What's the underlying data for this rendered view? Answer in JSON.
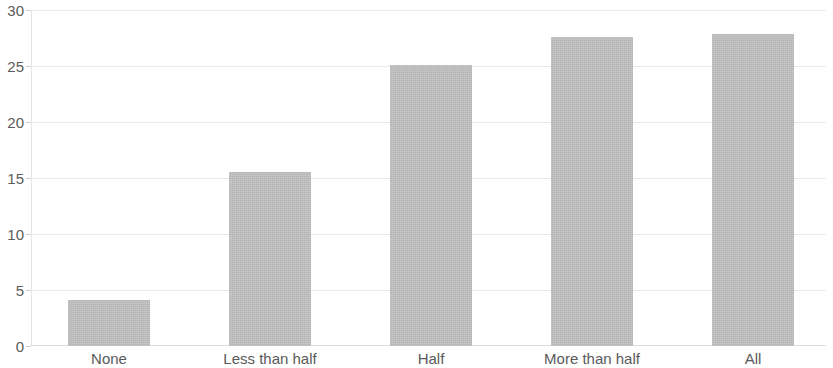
{
  "chart_data": {
    "type": "bar",
    "title": "",
    "subtitle": "",
    "xlabel": "",
    "ylabel": "",
    "categories": [
      "None",
      "Less than half",
      "Half",
      "More than half",
      "All"
    ],
    "values": [
      4.1,
      15.5,
      25.1,
      27.6,
      27.9
    ],
    "series": [
      {
        "name": "",
        "values": [
          4.1,
          15.5,
          25.1,
          27.6,
          27.9
        ]
      }
    ],
    "ylim": [
      0,
      30
    ],
    "y_ticks": [
      0,
      5,
      10,
      15,
      20,
      25,
      30
    ],
    "y_tick_labels": [
      "0",
      "5",
      "10",
      "15",
      "20",
      "25",
      "30"
    ],
    "grid": true,
    "grid_axis": "y",
    "legend": false,
    "legend_position": "none",
    "bar_color": "#bfbfbf",
    "grid_color": "#e9e9e9",
    "axis_color": "#e4e4e4",
    "tick_label_color": "#5a5a5a"
  }
}
